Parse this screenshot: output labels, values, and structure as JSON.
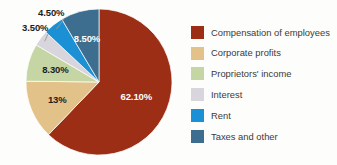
{
  "chart_data": {
    "type": "pie",
    "title": "",
    "subtitle": "",
    "xlabel": "",
    "ylabel": "",
    "legend_position": "right",
    "grid": false,
    "start_angle_deg": 0,
    "direction": "clockwise",
    "categories": [
      "Compensation of employees",
      "Corporate profits",
      "Proprietors' income",
      "Interest",
      "Rent",
      "Taxes and other"
    ],
    "values": [
      62.1,
      13,
      8.3,
      3.5,
      4.5,
      8.5
    ],
    "value_labels": [
      "62.10%",
      "13%",
      "8.30%",
      "3.50%",
      "4.50%",
      "8.50%"
    ],
    "colors": [
      "#9c2e16",
      "#e3c289",
      "#c5d6a4",
      "#d9d5dd",
      "#1c90d4",
      "#3d6e8f"
    ],
    "slices": [
      {
        "label": "Compensation of employees",
        "value": 62.1,
        "value_label": "62.10%",
        "color": "#9c2e16",
        "label_placement": "inside",
        "label_color": "#ffffff"
      },
      {
        "label": "Corporate profits",
        "value": 13,
        "value_label": "13%",
        "color": "#e3c289",
        "label_placement": "inside",
        "label_color": "#1d1d1b"
      },
      {
        "label": "Proprietors' income",
        "value": 8.3,
        "value_label": "8.30%",
        "color": "#c5d6a4",
        "label_placement": "inside",
        "label_color": "#1d1d1b"
      },
      {
        "label": "Interest",
        "value": 3.5,
        "value_label": "3.50%",
        "color": "#d9d5dd",
        "label_placement": "outside",
        "label_color": "#1d1d1b"
      },
      {
        "label": "Rent",
        "value": 4.5,
        "value_label": "4.50%",
        "color": "#1c90d4",
        "label_placement": "outside",
        "label_color": "#1d1d1b"
      },
      {
        "label": "Taxes and other",
        "value": 8.5,
        "value_label": "8.50%",
        "color": "#3d6e8f",
        "label_placement": "inside",
        "label_color": "#ffffff"
      }
    ]
  },
  "legend": {
    "items": [
      {
        "label": "Compensation of employees",
        "color": "#9c2e16"
      },
      {
        "label": "Corporate profits",
        "color": "#e3c289"
      },
      {
        "label": "Proprietors' income",
        "color": "#e3c289"
      },
      {
        "label": "Interest",
        "color": "#d9d5dd"
      },
      {
        "label": "Rent",
        "color": "#1c90d4"
      },
      {
        "label": "Taxes and other",
        "color": "#3d6e8f"
      }
    ]
  }
}
